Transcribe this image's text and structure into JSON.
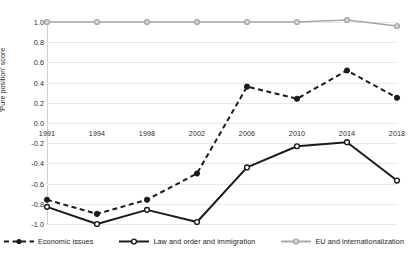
{
  "chart_data": {
    "type": "line",
    "title": "",
    "xlabel": "",
    "ylabel": "'Pure position' score",
    "x": [
      "1991",
      "1994",
      "1998",
      "2002",
      "2006",
      "2010",
      "2014",
      "2018"
    ],
    "categories": [
      "1991",
      "1994",
      "1998",
      "2002",
      "2006",
      "2010",
      "2014",
      "2018"
    ],
    "ylim": [
      -1.0,
      1.0
    ],
    "yticks": [
      "1.0",
      "0.8",
      "0.6",
      "0.4",
      "0.2",
      "0.0",
      "-0.2",
      "-0.4",
      "-0.6",
      "-0.8",
      "-1.0"
    ],
    "ytick_values": [
      1.0,
      0.8,
      0.6,
      0.4,
      0.2,
      0.0,
      -0.2,
      -0.4,
      -0.6,
      -0.8,
      -1.0
    ],
    "grid": true,
    "legend_position": "bottom",
    "series": [
      {
        "name": "Economic issues",
        "values": [
          -0.76,
          -0.9,
          -0.76,
          -0.5,
          0.36,
          0.24,
          0.52,
          0.25
        ],
        "color": "#1a1a1a",
        "style": "dashed",
        "marker": "filled-circle"
      },
      {
        "name": "Law and order and immigration",
        "values": [
          -0.83,
          -1.0,
          -0.86,
          -0.98,
          -0.44,
          -0.23,
          -0.19,
          -0.57
        ],
        "color": "#1a1a1a",
        "style": "solid",
        "marker": "open-circle"
      },
      {
        "name": "EU and internationalization",
        "values": [
          1.0,
          1.0,
          1.0,
          1.0,
          1.0,
          1.0,
          1.02,
          0.96
        ],
        "color": "#a6a6a6",
        "style": "solid",
        "marker": "open-circle"
      }
    ]
  }
}
